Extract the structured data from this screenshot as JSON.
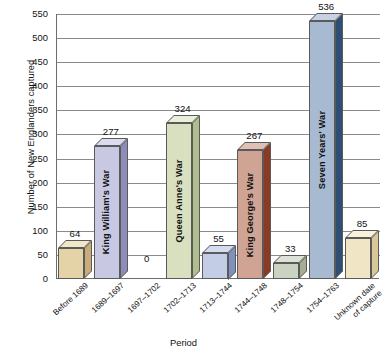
{
  "chart_data": {
    "type": "bar",
    "title": "",
    "xlabel": "Period",
    "ylabel": "Number of New Englanders captured",
    "ylim": [
      0,
      550
    ],
    "ytick_step": 50,
    "yticks": [
      "550",
      "500",
      "450",
      "400",
      "350",
      "300",
      "250",
      "200",
      "150",
      "100",
      "50",
      "0"
    ],
    "grid": true,
    "legend": "none",
    "style": "3d-isometric-bars",
    "categories": [
      "Before 1689",
      "1689–1697",
      "1697–1702",
      "1702–1713",
      "1713–1744",
      "1744–1748",
      "1748–1754",
      "1754–1763",
      "Unknown date of capture"
    ],
    "values": [
      64,
      277,
      0,
      324,
      55,
      267,
      33,
      536,
      85
    ],
    "value_labels": [
      "64",
      "277",
      "0",
      "324",
      "55",
      "267",
      "33",
      "536",
      "85"
    ],
    "bar_annotations": [
      "",
      "King William's War",
      "",
      "Queen Anne's War",
      "",
      "King George's War",
      "",
      "Seven Years' War",
      ""
    ],
    "colors": {
      "front": [
        "#e5d3a8",
        "#c8c8e2",
        "#ffffff",
        "#d9e0c0",
        "#c3cde6",
        "#cfa494",
        "#ccd2c2",
        "#a8bad2",
        "#f0e5c4"
      ],
      "top": [
        "#f2e6c8",
        "#dcdcee",
        "#ffffff",
        "#e9efd8",
        "#d6dcef",
        "#e0c0b2",
        "#dee2d6",
        "#c6d2e2",
        "#f8f1dc"
      ],
      "side": [
        "#c9ad78",
        "#8d8db8",
        "#ffffff",
        "#b0bd8c",
        "#7f92bc",
        "#8c3a24",
        "#a4ad95",
        "#2f4f72",
        "#d8c898"
      ]
    }
  },
  "axes": {
    "x_axis_title": "Period",
    "y_axis_title": "Number of New Englanders captured"
  }
}
